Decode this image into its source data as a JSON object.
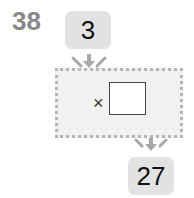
{
  "question": {
    "number": "38"
  },
  "machine": {
    "input_value": "3",
    "operator": "×",
    "answer_value": "",
    "output_value": "27"
  },
  "colors": {
    "box_fill": "#e2e2e2",
    "machine_fill": "#f1f1f1",
    "machine_border": "#b5b5b5",
    "arrow": "#a8a8a8",
    "question_number": "#888888"
  },
  "icons": {
    "input_arrows": "arrow-down-icon",
    "output_arrows": "arrow-down-icon"
  }
}
